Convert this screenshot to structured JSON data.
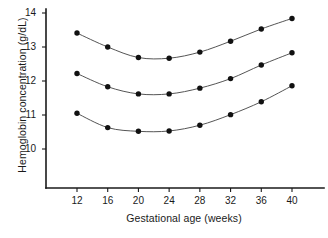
{
  "chart_data": {
    "type": "line",
    "title": "",
    "xlabel": "Gestational age (weeks)",
    "ylabel": "Hemoglobin concentration (g/dL)",
    "x": [
      12,
      16,
      20,
      24,
      28,
      32,
      36,
      40
    ],
    "xtick_labels": [
      "12",
      "16",
      "20",
      "24",
      "28",
      "32",
      "36",
      "40"
    ],
    "ytick_labels": [
      "14",
      "13",
      "12",
      "11",
      "10"
    ],
    "ytick_values": [
      14,
      13,
      12,
      11,
      10
    ],
    "xlim": [
      10,
      42
    ],
    "ylim": [
      9.3,
      14.05
    ],
    "grid": false,
    "legend": "none",
    "marker": "filled-circle",
    "line_color": "#555555",
    "marker_color": "#111111",
    "axis_color": "#1a1a1a",
    "background": "#ffffff",
    "series": [
      {
        "name": "upper-curve",
        "values": [
          13.41,
          13.0,
          12.69,
          12.67,
          12.85,
          13.17,
          13.53,
          13.84
        ]
      },
      {
        "name": "middle-curve",
        "values": [
          12.22,
          11.83,
          11.62,
          11.62,
          11.79,
          12.07,
          12.47,
          12.83
        ]
      },
      {
        "name": "lower-curve",
        "values": [
          11.05,
          10.63,
          10.52,
          10.53,
          10.7,
          11.01,
          11.39,
          11.86
        ]
      }
    ]
  },
  "axes": {
    "x_title": "Gestational age (weeks)",
    "y_title": "Hemoglobin concentration (g/dL)"
  }
}
